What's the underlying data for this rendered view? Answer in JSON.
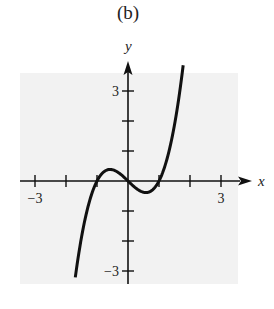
{
  "panel": {
    "label": "(b)"
  },
  "chart_data": {
    "type": "line",
    "title": "(b)",
    "xlabel": "x",
    "ylabel": "y",
    "xlim": [
      -3.5,
      3.5
    ],
    "ylim": [
      -3.5,
      3.5
    ],
    "grid": false,
    "background": "#f2f2f2",
    "x_ticks": [
      -3,
      -2,
      -1,
      0,
      1,
      2,
      3
    ],
    "y_ticks": [
      -3,
      -2,
      -1,
      0,
      1,
      2,
      3
    ],
    "x_tick_labels": [
      {
        "value": -3,
        "text": "−3"
      },
      {
        "value": 3,
        "text": "3"
      }
    ],
    "y_tick_labels": [
      {
        "value": 3,
        "text": "3"
      },
      {
        "value": -3,
        "text": "−3"
      }
    ],
    "series": [
      {
        "name": "y = x^3 - x",
        "x": [
          -1.7,
          -1.5,
          -1.25,
          -1.0,
          -0.75,
          -0.58,
          -0.4,
          -0.2,
          0.0,
          0.2,
          0.4,
          0.58,
          0.75,
          1.0,
          1.25,
          1.5,
          1.78
        ],
        "y": [
          -3.21,
          -1.88,
          -0.7,
          0.0,
          0.33,
          0.38,
          0.34,
          0.19,
          0.0,
          -0.19,
          -0.34,
          -0.38,
          -0.33,
          0.0,
          0.7,
          1.88,
          3.86
        ]
      }
    ],
    "annotations": [
      "x-intercepts at -1, 0, 1"
    ]
  }
}
